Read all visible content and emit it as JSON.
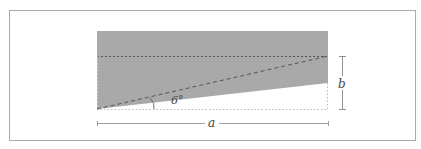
{
  "diagram": {
    "labels": {
      "angle": "6°",
      "width": "a",
      "height": "b"
    },
    "colors": {
      "fill": "#a9a9a9",
      "frame": "#aaaaaa",
      "dashed": "#555555",
      "dotted_light": "#bbbbbb",
      "dimension": "#777777"
    }
  }
}
